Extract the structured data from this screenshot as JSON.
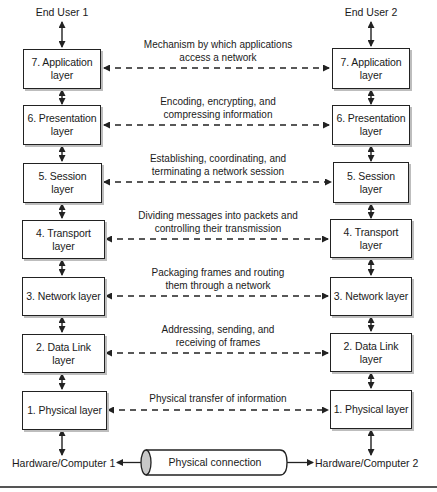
{
  "diagram": {
    "end_users": {
      "left": "End User 1",
      "right": "End User 2"
    },
    "layers": [
      {
        "number": 7,
        "left_label": "7. Application layer",
        "right_label": "7. Application layer",
        "description": "Mechanism by which applications access a network",
        "desc_line1": "Mechanism by which applications",
        "desc_line2": "access a network"
      },
      {
        "number": 6,
        "left_label": "6. Presentation layer",
        "right_label": "6. Presentation layer",
        "description": "Encoding, encrypting, and compressing information",
        "desc_line1": "Encoding, encrypting, and",
        "desc_line2": "compressing information"
      },
      {
        "number": 5,
        "left_label": "5. Session layer",
        "right_label": "5. Session layer",
        "description": "Establishing, coordinating, and terminating a network session",
        "desc_line1": "Establishing, coordinating, and",
        "desc_line2": "terminating a network session"
      },
      {
        "number": 4,
        "left_label": "4. Transport layer",
        "right_label": "4. Transport layer",
        "description": "Dividing messages into packets and controlling their transmission",
        "desc_line1": "Dividing messages into packets and",
        "desc_line2": "controlling their transmission"
      },
      {
        "number": 3,
        "left_label": "3. Network layer",
        "right_label": "3. Network layer",
        "description": "Packaging frames and routing them through a network",
        "desc_line1": "Packaging frames and routing",
        "desc_line2": "them through a network"
      },
      {
        "number": 2,
        "left_label": "2. Data Link layer",
        "right_label": "2. Data Link layer",
        "description": "Addressing, sending, and receiving of frames",
        "desc_line1": "Addressing, sending, and",
        "desc_line2": "receiving of frames"
      },
      {
        "number": 1,
        "left_label": "1. Physical layer",
        "right_label": "1. Physical layer",
        "description": "Physical transfer of information",
        "desc_line1": "Physical transfer of information",
        "desc_line2": ""
      }
    ],
    "hardware": {
      "left": "Hardware/Computer 1",
      "right": "Hardware/Computer 2"
    },
    "connection": "Physical connection",
    "colors": {
      "line": "#222222",
      "box_shadow": "#bdbdbd",
      "cylinder_cap": "#c8c8c8",
      "rule": "#555555"
    }
  }
}
